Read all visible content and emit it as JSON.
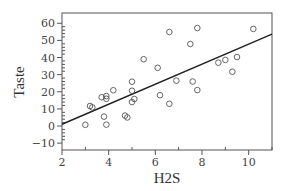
{
  "chart_data": {
    "type": "scatter",
    "title": "",
    "xlabel": "H2S",
    "ylabel": "Taste",
    "xlim": [
      2,
      11
    ],
    "ylim": [
      -14,
      66
    ],
    "x_ticks": [
      2,
      4,
      6,
      8,
      10
    ],
    "y_ticks": [
      -10,
      0,
      10,
      20,
      30,
      40,
      50,
      60
    ],
    "grid": false,
    "legend": null,
    "series": [
      {
        "name": "observations",
        "marker": "open-circle",
        "points": [
          [
            3.0,
            0.7
          ],
          [
            3.2,
            11.7
          ],
          [
            3.3,
            10.9
          ],
          [
            3.7,
            16.8
          ],
          [
            3.9,
            17.5
          ],
          [
            3.9,
            15.9
          ],
          [
            4.2,
            20.9
          ],
          [
            3.8,
            5.5
          ],
          [
            3.9,
            0.8
          ],
          [
            4.7,
            6.1
          ],
          [
            4.8,
            5.0
          ],
          [
            5.0,
            14.0
          ],
          [
            5.1,
            15.8
          ],
          [
            5.0,
            25.9
          ],
          [
            5.0,
            20.6
          ],
          [
            5.5,
            39.0
          ],
          [
            6.1,
            34.0
          ],
          [
            6.2,
            18.0
          ],
          [
            6.6,
            13.0
          ],
          [
            6.6,
            54.9
          ],
          [
            6.9,
            26.5
          ],
          [
            7.5,
            47.9
          ],
          [
            7.8,
            57.2
          ],
          [
            7.6,
            26.0
          ],
          [
            7.8,
            21.0
          ],
          [
            8.7,
            37.0
          ],
          [
            9.0,
            38.6
          ],
          [
            9.5,
            40.3
          ],
          [
            9.3,
            31.7
          ],
          [
            10.2,
            56.7
          ]
        ]
      }
    ],
    "fit_line": {
      "name": "least-squares line",
      "intercept": -10.7,
      "slope": 5.85,
      "x_range": [
        2,
        11
      ]
    }
  }
}
